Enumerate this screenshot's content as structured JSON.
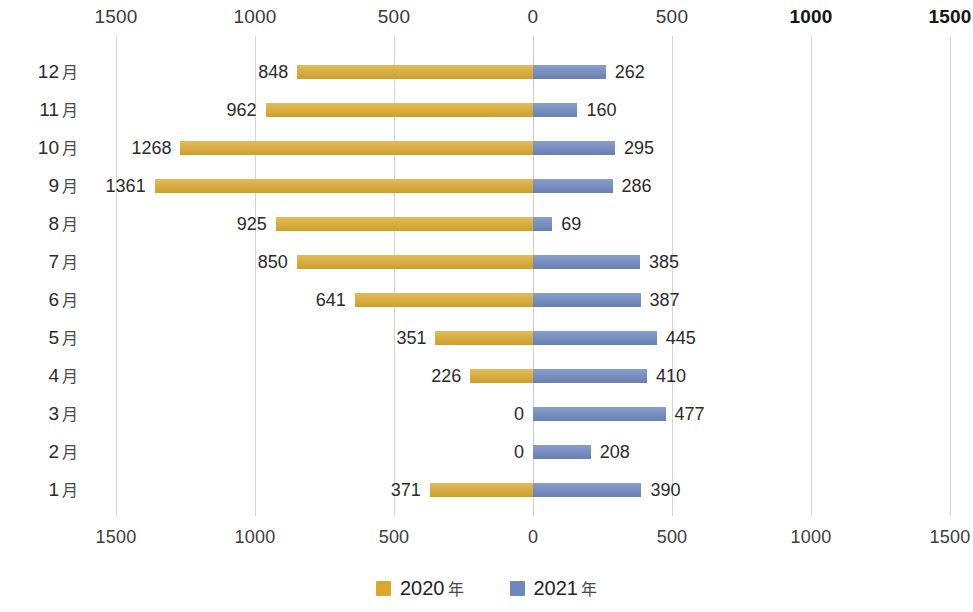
{
  "chart_data": {
    "type": "bar",
    "subtype": "butterfly-diverging-horizontal-bar",
    "title": "",
    "xlabel": "",
    "ylabel": "",
    "grid": true,
    "legend_position": "bottom-center",
    "categories": [
      "12 月",
      "11 月",
      "10 月",
      "9 月",
      "8 月",
      "7 月",
      "6 月",
      "5 月",
      "4 月",
      "3 月",
      "2 月",
      "1 月"
    ],
    "category_order_top_to_bottom": [
      "12 月",
      "11 月",
      "10 月",
      "9 月",
      "8 月",
      "7 月",
      "6 月",
      "5 月",
      "4 月",
      "3 月",
      "2 月",
      "1 月"
    ],
    "series": [
      {
        "name": "2020 年",
        "side": "left",
        "color": "#d9a82c",
        "values": [
          848,
          962,
          1268,
          1361,
          925,
          850,
          641,
          351,
          226,
          0,
          0,
          371
        ]
      },
      {
        "name": "2021 年",
        "side": "right",
        "color": "#6e88be",
        "values": [
          262,
          160,
          295,
          286,
          69,
          385,
          387,
          445,
          410,
          477,
          208,
          390
        ]
      }
    ],
    "axis_ticks_top": [
      "1500",
      "1000",
      "500",
      "0",
      "500",
      "1000",
      "1500"
    ],
    "axis_ticks_bottom": [
      "1500",
      "1000",
      "500",
      "0",
      "500",
      "1000",
      "1500"
    ],
    "axis_tick_values": [
      -1500,
      -1000,
      -500,
      0,
      500,
      1000,
      1500
    ],
    "xlim": [
      -1550,
      1580
    ],
    "emphasized_top_ticks": [
      "1000",
      "1500"
    ]
  },
  "legend": {
    "items": [
      {
        "label": "2020",
        "suffix": "年",
        "color": "#d9a82c",
        "swatch": "legend-swatch-2020"
      },
      {
        "label": "2021",
        "suffix": "年",
        "color": "#6e88be",
        "swatch": "legend-swatch-2021"
      }
    ]
  },
  "colors": {
    "left_series": "#d9a82c",
    "right_series": "#6e88be",
    "gridline": "#d4d4d4",
    "text": "#2b2b2b",
    "background": "#ffffff"
  }
}
